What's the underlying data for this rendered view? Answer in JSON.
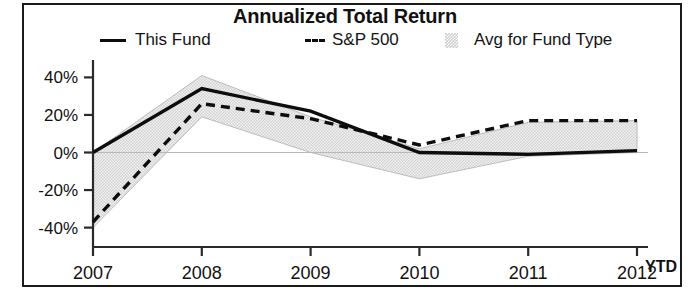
{
  "chart_data": {
    "type": "line",
    "title": "Annualized Total Return",
    "xlabel": "",
    "ylabel": "",
    "x": [
      "2007",
      "2008",
      "2009",
      "2010",
      "2011",
      "2012"
    ],
    "categories": [
      "2007",
      "2008",
      "2009",
      "2010",
      "2011",
      "2012"
    ],
    "ylim": [
      -45,
      45
    ],
    "yticks": [
      40,
      20,
      0,
      -20,
      -40
    ],
    "ytick_labels": [
      "40%",
      "20%",
      "0%",
      "-20%",
      "-40%"
    ],
    "grid": false,
    "legend_position": "top",
    "x_axis_note": "YTD",
    "series": [
      {
        "name": "This Fund",
        "style": "solid",
        "color": "#0d0d0d",
        "values": [
          0,
          34,
          22,
          0,
          -1,
          1
        ]
      },
      {
        "name": "S&P 500",
        "style": "dashed",
        "color": "#0d0d0d",
        "values": [
          -37,
          26,
          18,
          4,
          17,
          17
        ]
      },
      {
        "name": "Avg for Fund Type",
        "style": "shaded-band",
        "color": "#cfcfcf",
        "band_upper": [
          0,
          41,
          19,
          2,
          16,
          17
        ],
        "band_lower": [
          -40,
          19,
          0,
          -14,
          -2,
          0
        ]
      }
    ]
  },
  "legend": {
    "items": [
      {
        "label": "This Fund",
        "swatch": "solid-line-swatch"
      },
      {
        "label": "S&P 500",
        "swatch": "dashed-line-swatch"
      },
      {
        "label": "Avg for Fund Type",
        "swatch": "shaded-area-swatch"
      }
    ]
  },
  "axes": {
    "y_labels": [
      "40%",
      "20%",
      "0%",
      "-20%",
      "-40%"
    ],
    "x_labels": [
      "2007",
      "2008",
      "2009",
      "2010",
      "2011",
      "2012"
    ],
    "ytd": "YTD"
  },
  "colors": {
    "line": "#0d0d0d",
    "band": "#cfcfcf",
    "frame": "#1b1b1b",
    "text": "#111111"
  }
}
